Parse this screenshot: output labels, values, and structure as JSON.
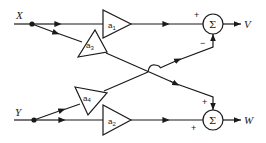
{
  "diagram": {
    "type": "block-diagram",
    "inputs": [
      {
        "id": "X",
        "label": "X"
      },
      {
        "id": "Y",
        "label": "Y"
      }
    ],
    "outputs": [
      {
        "id": "V",
        "label": "V"
      },
      {
        "id": "W",
        "label": "W"
      }
    ],
    "gains": [
      {
        "id": "a1",
        "label": "a",
        "sub": "1",
        "from": "X",
        "to": "sum_top"
      },
      {
        "id": "a3",
        "label": "a",
        "sub": "3",
        "from": "X",
        "to": "sum_bottom"
      },
      {
        "id": "a4",
        "label": "a",
        "sub": "4",
        "from": "Y",
        "to": "sum_top"
      },
      {
        "id": "a2",
        "label": "a",
        "sub": "2",
        "from": "Y",
        "to": "sum_bottom"
      }
    ],
    "summers": [
      {
        "id": "sum_top",
        "symbol": "Σ",
        "inputs": [
          {
            "from": "a1",
            "sign": "+"
          },
          {
            "from": "a4",
            "sign": "−"
          }
        ],
        "output": "V"
      },
      {
        "id": "sum_bottom",
        "symbol": "Σ",
        "inputs": [
          {
            "from": "a3",
            "sign": "+"
          },
          {
            "from": "a2",
            "sign": "+"
          }
        ],
        "output": "W"
      }
    ]
  },
  "labels": {
    "x": "X",
    "y": "Y",
    "v": "V",
    "w": "W",
    "a": "a",
    "sub1": "1",
    "sub2": "2",
    "sub3": "3",
    "sub4": "4",
    "sigma": "Σ",
    "plus": "+",
    "minus": "−"
  }
}
